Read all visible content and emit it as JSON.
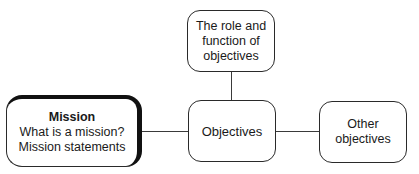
{
  "diagram": {
    "nodes": {
      "mission": {
        "title": "Mission",
        "lines": [
          "What is a mission?",
          "Mission statements"
        ]
      },
      "center": {
        "label": "Objectives"
      },
      "top": {
        "lines": [
          "The role and",
          "function of",
          "objectives"
        ]
      },
      "other": {
        "lines": [
          "Other",
          "objectives"
        ]
      }
    },
    "edges": [
      {
        "from": "mission",
        "to": "center"
      },
      {
        "from": "top",
        "to": "center"
      },
      {
        "from": "center",
        "to": "other"
      }
    ]
  }
}
